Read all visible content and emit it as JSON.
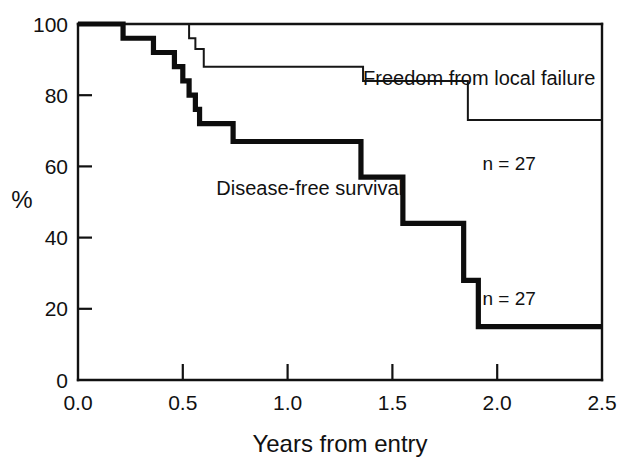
{
  "chart_data": {
    "type": "line",
    "title": "",
    "subtitle": "",
    "xlabel": "Years from entry",
    "ylabel": "%",
    "xlim": [
      0.0,
      2.5
    ],
    "ylim": [
      0,
      100
    ],
    "grid": false,
    "legend_position": "inline-annotations",
    "xticks": [
      0.0,
      0.5,
      1.0,
      1.5,
      2.0,
      2.5
    ],
    "xtick_labels": [
      "0.0",
      "0.5",
      "1.0",
      "1.5",
      "2.0",
      "2.5"
    ],
    "yticks": [
      0,
      20,
      40,
      60,
      80,
      100
    ],
    "ytick_labels": [
      "0",
      "20",
      "40",
      "60",
      "80",
      "100"
    ],
    "series": [
      {
        "name": "Freedom from local failure",
        "style": "thin",
        "n": 27,
        "n_label": "n = 27",
        "label_x": 1.36,
        "label_y": 83,
        "n_label_x": 1.93,
        "n_label_y": 59,
        "steps": [
          {
            "x": 0.0,
            "y": 100
          },
          {
            "x": 0.53,
            "y": 100
          },
          {
            "x": 0.53,
            "y": 96
          },
          {
            "x": 0.56,
            "y": 96
          },
          {
            "x": 0.56,
            "y": 93
          },
          {
            "x": 0.6,
            "y": 93
          },
          {
            "x": 0.6,
            "y": 88
          },
          {
            "x": 1.36,
            "y": 88
          },
          {
            "x": 1.36,
            "y": 84
          },
          {
            "x": 1.86,
            "y": 84
          },
          {
            "x": 1.86,
            "y": 73
          },
          {
            "x": 2.5,
            "y": 73
          }
        ]
      },
      {
        "name": "Disease-free survival",
        "style": "thick",
        "n": 27,
        "n_label": "n = 27",
        "label_x": 0.66,
        "label_y": 52,
        "n_label_x": 1.93,
        "n_label_y": 21,
        "steps": [
          {
            "x": 0.0,
            "y": 100
          },
          {
            "x": 0.215,
            "y": 100
          },
          {
            "x": 0.215,
            "y": 96
          },
          {
            "x": 0.36,
            "y": 96
          },
          {
            "x": 0.36,
            "y": 92
          },
          {
            "x": 0.46,
            "y": 92
          },
          {
            "x": 0.46,
            "y": 88
          },
          {
            "x": 0.5,
            "y": 88
          },
          {
            "x": 0.5,
            "y": 84
          },
          {
            "x": 0.53,
            "y": 84
          },
          {
            "x": 0.53,
            "y": 80
          },
          {
            "x": 0.56,
            "y": 80
          },
          {
            "x": 0.56,
            "y": 76
          },
          {
            "x": 0.58,
            "y": 76
          },
          {
            "x": 0.58,
            "y": 72
          },
          {
            "x": 0.74,
            "y": 72
          },
          {
            "x": 0.74,
            "y": 67
          },
          {
            "x": 1.35,
            "y": 67
          },
          {
            "x": 1.35,
            "y": 57
          },
          {
            "x": 1.55,
            "y": 57
          },
          {
            "x": 1.55,
            "y": 44
          },
          {
            "x": 1.84,
            "y": 44
          },
          {
            "x": 1.84,
            "y": 28
          },
          {
            "x": 1.91,
            "y": 28
          },
          {
            "x": 1.91,
            "y": 15
          },
          {
            "x": 2.5,
            "y": 15
          }
        ]
      }
    ],
    "annotations": [
      {
        "text": "Freedom from local failure",
        "x": 1.36,
        "y": 83
      },
      {
        "text": "Disease-free survival",
        "x": 0.66,
        "y": 52
      },
      {
        "text": "n = 27",
        "x": 1.93,
        "y": 59
      },
      {
        "text": "n = 27",
        "x": 1.93,
        "y": 21
      }
    ]
  },
  "colors": {
    "background": "#ffffff",
    "axis": "#111111",
    "thick_series": "#0d0d0d",
    "thin_series": "#161616",
    "text": "#111111"
  }
}
